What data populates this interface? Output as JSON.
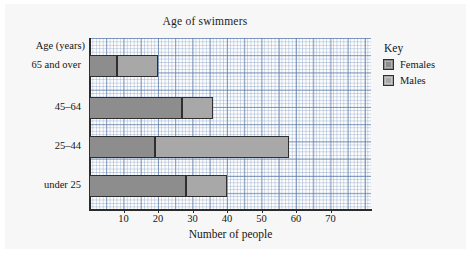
{
  "chart_data": {
    "type": "bar",
    "orientation": "horizontal",
    "stacked": true,
    "title": "Age of swimmers",
    "xlabel": "Number of people",
    "ylabel": "Age (years)",
    "categories": [
      "65 and over",
      "45–64",
      "25–44",
      "under 25"
    ],
    "series": [
      {
        "name": "Females",
        "color": "#8d8d8d",
        "values": [
          8,
          27,
          19,
          28
        ]
      },
      {
        "name": "Males",
        "color": "#a8a8a8",
        "values": [
          12,
          9,
          39,
          12
        ]
      }
    ],
    "cumulative_ends": [
      20,
      36,
      58,
      40
    ],
    "xlim": [
      0,
      78
    ],
    "xticks": [
      10,
      20,
      30,
      40,
      50,
      60,
      70
    ],
    "xtick_labels": [
      "10",
      "20",
      "30",
      "40",
      "50",
      "60",
      "70"
    ],
    "grid": true,
    "grid_style": "graph-paper",
    "legend_title": "Key",
    "legend_position": "right",
    "legend_entries": [
      "Females",
      "Males"
    ]
  },
  "legend": {
    "title": "Key",
    "items": [
      {
        "label": "Females",
        "color": "#8d8d8d"
      },
      {
        "label": "Males",
        "color": "#a8a8a8"
      }
    ]
  },
  "axes": {
    "y_title": "Age (years)",
    "x_title": "Number of people",
    "y_categories": [
      "65 and over",
      "45–64",
      "25–44",
      "under 25"
    ],
    "x_tick_labels": [
      "10",
      "20",
      "30",
      "40",
      "50",
      "60",
      "70"
    ]
  },
  "title": "Age of swimmers"
}
